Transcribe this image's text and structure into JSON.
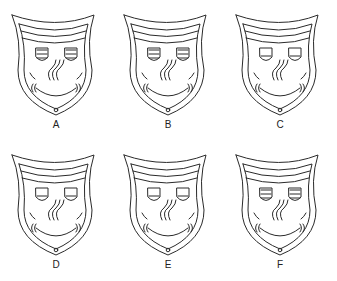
{
  "title": "",
  "stroke_color": "#2a2a2a",
  "masks": [
    {
      "label": "A",
      "eyes": "three-line",
      "col": 0,
      "row": 0
    },
    {
      "label": "B",
      "eyes": "three-line",
      "col": 1,
      "row": 0
    },
    {
      "label": "C",
      "eyes": "one-line",
      "col": 2,
      "row": 0
    },
    {
      "label": "D",
      "eyes": "one-line",
      "col": 0,
      "row": 1
    },
    {
      "label": "E",
      "eyes": "one-line",
      "col": 1,
      "row": 1
    },
    {
      "label": "F",
      "eyes": "three-line",
      "col": 2,
      "row": 1
    }
  ]
}
